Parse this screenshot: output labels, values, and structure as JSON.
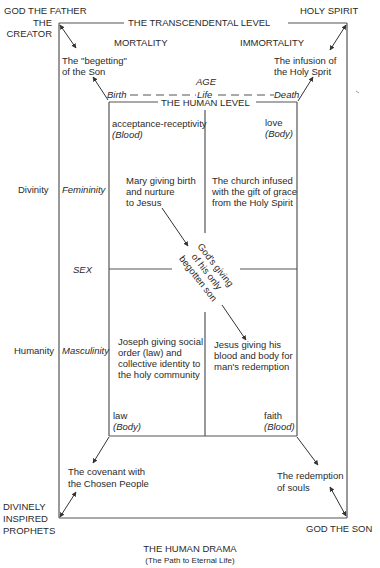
{
  "corners": {
    "top_left": {
      "line1": "GOD THE FATHER",
      "line2": "THE",
      "line3": "CREATOR"
    },
    "top_right": "HOLY SPIRIT",
    "bottom_left": {
      "line1": "DIVINELY",
      "line2": "INSPIRED",
      "line3": "PROPHETS"
    },
    "bottom_right": "GOD THE SON"
  },
  "levels": {
    "transcendental": "THE TRANSCENDENTAL LEVEL",
    "human": "THE HUMAN LEVEL"
  },
  "top_labels": {
    "mortality": "MORTALITY",
    "immortality": "IMMORTALITY"
  },
  "diagonals": {
    "top_left": {
      "line1": "The \"begetting\"",
      "line2": "of the Son"
    },
    "top_right": {
      "line1": "The infusion of",
      "line2": "the Holy Sprit"
    },
    "bottom_left": {
      "line1": "The covenant with",
      "line2": "the Chosen People"
    },
    "bottom_right": {
      "line1": "The redemption",
      "line2": "of souls"
    }
  },
  "age_axis": {
    "title": "AGE",
    "birth": "Birth",
    "life": "Life",
    "death": "Death"
  },
  "left_axis": {
    "divinity": "Divinity",
    "humanity": "Humanity",
    "femininity": "Femininity",
    "sex": "SEX",
    "masculinity": "Masculinity"
  },
  "quadrants": {
    "top_left": {
      "corner_label": "acceptance-receptivity",
      "corner_sub": "(Blood)",
      "body": {
        "line1": "Mary giving birth",
        "line2": "and nurture",
        "line3": "to Jesus"
      }
    },
    "top_right": {
      "corner_label": "love",
      "corner_sub": "(Body)",
      "body": {
        "line1": "The church infused",
        "line2": "with the gift of grace",
        "line3": "from the Holy Spirit"
      }
    },
    "bottom_left": {
      "corner_label": "law",
      "corner_sub": "(Body)",
      "body": {
        "line1": "Joseph giving social",
        "line2": "order (law) and",
        "line3": "collective identity to",
        "line4": "the holy community"
      }
    },
    "bottom_right": {
      "corner_label": "faith",
      "corner_sub": "(Blood)",
      "body": {
        "line1": "Jesus giving his",
        "line2": "blood and body for",
        "line3": "man's redemption"
      }
    }
  },
  "center": {
    "line1": "God's giving",
    "line2": "of his only",
    "line3": "begotten son"
  },
  "footer": {
    "title": "THE HUMAN DRAMA",
    "subtitle": "(The Path to Eternal Life)"
  },
  "colors": {
    "line": "#555555",
    "text": "#2a2a2a",
    "background": "#ffffff"
  }
}
